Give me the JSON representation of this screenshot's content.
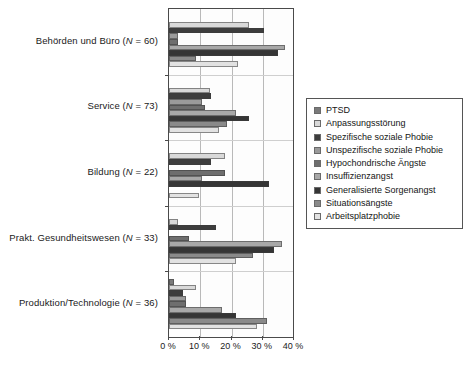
{
  "chart_data": {
    "type": "bar",
    "orientation": "horizontal",
    "title": "",
    "subtitle": "",
    "xlabel": "",
    "ylabel": "",
    "xlim": [
      0,
      40
    ],
    "xunit": "%",
    "grid": true,
    "gridlines_x": [
      0,
      10,
      20,
      30,
      40
    ],
    "legend_position": "right",
    "xticks": [
      "0 %",
      "10 %",
      "20 %",
      "30 %",
      "40 %"
    ],
    "xtick_values": [
      0,
      10,
      20,
      30,
      40
    ],
    "categories": [
      "Behörden und Büro (N = 60)",
      "Service (N = 73)",
      "Bildung (N = 22)",
      "Prakt. Gesundheitswesen (N = 33)",
      "Produktion/Technologie (N = 36)"
    ],
    "category_labels": [
      {
        "text": "Behörden und Büro (",
        "italic": "N",
        "rest": " = 60)"
      },
      {
        "text": "Service (",
        "italic": "N",
        "rest": " = 73)"
      },
      {
        "text": "Bildung (",
        "italic": "N",
        "rest": " = 22)"
      },
      {
        "text": "Prakt. Gesundheitswesen (",
        "italic": "N",
        "rest": " = 33)"
      },
      {
        "text": "Produktion/Technologie (",
        "italic": "N",
        "rest": " = 36)"
      }
    ],
    "series": [
      {
        "name": "PTSD",
        "color": "#7a7a7a",
        "values": [
          0.0,
          0.0,
          0.0,
          0.0,
          1.5
        ]
      },
      {
        "name": "Anpassungsstörung",
        "color": "#d9d9d9",
        "values": [
          25.5,
          13.0,
          18.0,
          3.0,
          8.5
        ]
      },
      {
        "name": "Spezifische soziale Phobie",
        "color": "#3d3d3d",
        "values": [
          30.5,
          13.5,
          13.5,
          15.0,
          4.5
        ]
      },
      {
        "name": "Unspezifische soziale Phobie",
        "color": "#9a9a9a",
        "values": [
          3.0,
          10.5,
          0.0,
          0.0,
          5.5
        ]
      },
      {
        "name": "Hypochondrische Ängste",
        "color": "#6e6e6e",
        "values": [
          3.0,
          11.5,
          18.0,
          6.5,
          5.5
        ]
      },
      {
        "name": "Insuffizienzangst",
        "color": "#a8a8a8",
        "values": [
          37.0,
          21.5,
          10.5,
          36.0,
          17.0
        ]
      },
      {
        "name": "Generalisierte Sorgenangst",
        "color": "#353535",
        "values": [
          35.0,
          25.5,
          32.0,
          33.5,
          21.5
        ]
      },
      {
        "name": "Situationsängste",
        "color": "#8a8a8a",
        "values": [
          8.5,
          18.5,
          0.0,
          27.0,
          31.5
        ]
      },
      {
        "name": "Arbeitsplatzphobie",
        "color": "#e2e2e2",
        "values": [
          22.0,
          16.0,
          9.5,
          21.5,
          28.0
        ]
      }
    ],
    "series_by_group": [
      {
        "group": "Behörden und Büro (N = 60)",
        "bars": [
          {
            "series": "PTSD",
            "value": 0.0
          },
          {
            "series": "Anpassungsstörung",
            "value": 25.5
          },
          {
            "series": "Spezifische soziale Phobie",
            "value": 30.5
          },
          {
            "series": "Unspezifische soziale Phobie",
            "value": 3.0
          },
          {
            "series": "Hypochondrische Ängste",
            "value": 3.0
          },
          {
            "series": "Insuffizienzangst",
            "value": 37.0
          },
          {
            "series": "Generalisierte Sorgenangst",
            "value": 35.0
          },
          {
            "series": "Situationsängste",
            "value": 8.5
          },
          {
            "series": "Arbeitsplatzphobie",
            "value": 22.0
          }
        ]
      },
      {
        "group": "Service (N = 73)",
        "bars": [
          {
            "series": "PTSD",
            "value": 0.0
          },
          {
            "series": "Anpassungsstörung",
            "value": 13.0
          },
          {
            "series": "Spezifische soziale Phobie",
            "value": 13.5
          },
          {
            "series": "Unspezifische soziale Phobie",
            "value": 10.5
          },
          {
            "series": "Hypochondrische Ängste",
            "value": 11.5
          },
          {
            "series": "Insuffizienzangst",
            "value": 21.5
          },
          {
            "series": "Generalisierte Sorgenangst",
            "value": 25.5
          },
          {
            "series": "Situationsängste",
            "value": 18.5
          },
          {
            "series": "Arbeitsplatzphobie",
            "value": 16.0
          }
        ]
      },
      {
        "group": "Bildung (N = 22)",
        "bars": [
          {
            "series": "PTSD",
            "value": 0.0
          },
          {
            "series": "Anpassungsstörung",
            "value": 18.0
          },
          {
            "series": "Spezifische soziale Phobie",
            "value": 13.5
          },
          {
            "series": "Unspezifische soziale Phobie",
            "value": 0.0
          },
          {
            "series": "Hypochondrische Ängste",
            "value": 18.0
          },
          {
            "series": "Insuffizienzangst",
            "value": 10.5
          },
          {
            "series": "Generalisierte Sorgenangst",
            "value": 32.0
          },
          {
            "series": "Situationsängste",
            "value": 0.0
          },
          {
            "series": "Arbeitsplatzphobie",
            "value": 9.5
          }
        ]
      },
      {
        "group": "Prakt. Gesundheitswesen (N = 33)",
        "bars": [
          {
            "series": "PTSD",
            "value": 0.0
          },
          {
            "series": "Anpassungsstörung",
            "value": 3.0
          },
          {
            "series": "Spezifische soziale Phobie",
            "value": 15.0
          },
          {
            "series": "Unspezifische soziale Phobie",
            "value": 0.0
          },
          {
            "series": "Hypochondrische Ängste",
            "value": 6.5
          },
          {
            "series": "Insuffizienzangst",
            "value": 36.0
          },
          {
            "series": "Generalisierte Sorgenangst",
            "value": 33.5
          },
          {
            "series": "Situationsängste",
            "value": 27.0
          },
          {
            "series": "Arbeitsplatzphobie",
            "value": 21.5
          }
        ]
      },
      {
        "group": "Produktion/Technologie (N = 36)",
        "bars": [
          {
            "series": "PTSD",
            "value": 1.5
          },
          {
            "series": "Anpassungsstörung",
            "value": 8.5
          },
          {
            "series": "Spezifische soziale Phobie",
            "value": 4.5
          },
          {
            "series": "Unspezifische soziale Phobie",
            "value": 5.5
          },
          {
            "series": "Hypochondrische Ängste",
            "value": 5.5
          },
          {
            "series": "Insuffizienzangst",
            "value": 17.0
          },
          {
            "series": "Generalisierte Sorgenangst",
            "value": 21.5
          },
          {
            "series": "Situationsängste",
            "value": 31.5
          },
          {
            "series": "Arbeitsplatzphobie",
            "value": 28.0
          }
        ]
      }
    ]
  },
  "legend": {
    "items": [
      {
        "label": "PTSD",
        "color": "#7a7a7a"
      },
      {
        "label": "Anpassungsstörung",
        "color": "#d9d9d9"
      },
      {
        "label": "Spezifische soziale Phobie",
        "color": "#3d3d3d"
      },
      {
        "label": "Unspezifische soziale Phobie",
        "color": "#9a9a9a"
      },
      {
        "label": "Hypochondrische Ängste",
        "color": "#6e6e6e"
      },
      {
        "label": "Insuffizienzangst",
        "color": "#a8a8a8"
      },
      {
        "label": "Generalisierte Sorgenangst",
        "color": "#353535"
      },
      {
        "label": "Situationsängste",
        "color": "#8a8a8a"
      },
      {
        "label": "Arbeitsplatzphobie",
        "color": "#e2e2e2"
      }
    ]
  },
  "axis": {
    "x_tick_labels": [
      "0 %",
      "10 %",
      "20 %",
      "30 %",
      "40 %"
    ]
  }
}
